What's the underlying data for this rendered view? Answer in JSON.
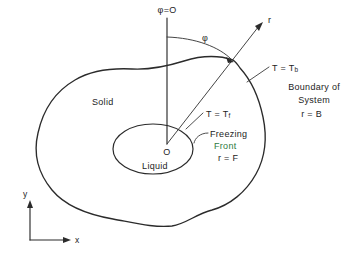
{
  "figure": {
    "type": "schematic-diagram",
    "background_color": "#ffffff",
    "line_color": "#2b2b2b",
    "accent_color": "#2f7a3f"
  },
  "labels": {
    "phi_zero": "φ=O",
    "phi_angle": "φ",
    "radius_axis": "r",
    "origin": "O",
    "liquid_region": "Liquid",
    "solid_region": "Solid",
    "temp_boundary_prefix": "T = T",
    "temp_boundary_sub": "b",
    "temp_front_prefix": "T = T",
    "temp_front_sub": "f",
    "boundary_line1": "Boundary of",
    "boundary_line2": "System",
    "boundary_line3": "r = B",
    "front_line1": "Freezing",
    "front_line2": "Front",
    "front_line3": "r = F",
    "axis_y": "y",
    "axis_x": "x"
  },
  "geometry": {
    "origin_point": {
      "x": 167,
      "y": 146
    },
    "boundary_intersection": {
      "x": 233,
      "y": 60
    },
    "phi_reference_top": {
      "x": 167,
      "y": 18
    },
    "r_arrow_tip": {
      "x": 263,
      "y": 23
    },
    "inner_ellipse": {
      "cx": 153,
      "cy": 149,
      "rx": 40,
      "ry": 25
    },
    "axes_corner": {
      "x": 30,
      "y": 240
    }
  }
}
